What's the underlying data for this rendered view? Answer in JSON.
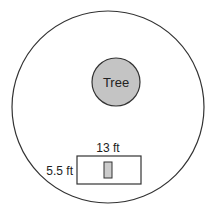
{
  "diagram": {
    "outer_circle": {
      "cx": 108,
      "cy": 107,
      "r": 96,
      "stroke": "#333333",
      "fill": "#ffffff"
    },
    "tree": {
      "label": "Tree",
      "cx": 116,
      "cy": 82,
      "r": 24,
      "fill": "#c4c4c4",
      "stroke": "#333333"
    },
    "rectangle": {
      "x": 77,
      "y": 156,
      "width": 64,
      "height": 28,
      "stroke": "#333333",
      "fill": "#ffffff"
    },
    "inner_rect": {
      "x": 104,
      "y": 162,
      "width": 8,
      "height": 16,
      "fill": "#cccccc",
      "stroke": "#333333"
    },
    "labels": {
      "width_label": "13 ft",
      "height_label": "5.5 ft"
    }
  }
}
